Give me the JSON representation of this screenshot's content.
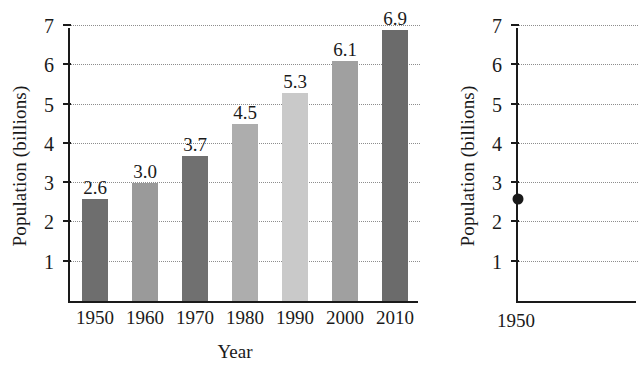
{
  "chart_data": [
    {
      "id": "world-population-bar",
      "type": "bar",
      "title": "",
      "xlabel": "Year",
      "ylabel": "Population (billions)",
      "categories": [
        "1950",
        "1960",
        "1970",
        "1980",
        "1990",
        "2000",
        "2010"
      ],
      "values": [
        2.6,
        3.0,
        3.7,
        4.5,
        5.3,
        6.1,
        6.9
      ],
      "value_labels": [
        "2.6",
        "3.0",
        "3.7",
        "4.5",
        "5.3",
        "6.1",
        "6.9"
      ],
      "bar_colors": [
        "#6e6e6e",
        "#9a9a9a",
        "#707070",
        "#adadad",
        "#c9c9c9",
        "#a0a0a0",
        "#6b6b6b"
      ],
      "ylim": [
        0,
        7
      ],
      "yticks": [
        1,
        2,
        3,
        4,
        5,
        6,
        7
      ],
      "ytick_labels": [
        "1",
        "2",
        "3",
        "4",
        "5",
        "6",
        "7"
      ],
      "grid": "horizontal-dotted",
      "legend": "none"
    },
    {
      "id": "world-population-scatter-partial",
      "type": "scatter",
      "title": "",
      "xlabel": "",
      "ylabel": "Population (billions)",
      "note": "second panel, clipped at right edge of screenshot",
      "categories": [
        "1950"
      ],
      "x": [
        "1950"
      ],
      "values": [
        2.6
      ],
      "point_color": "#1a1a1a",
      "ylim": [
        0,
        7
      ],
      "yticks": [
        1,
        2,
        3,
        4,
        5,
        6,
        7
      ],
      "ytick_labels": [
        "1",
        "2",
        "3",
        "4",
        "5",
        "6",
        "7"
      ],
      "xtick_labels": [
        "1950"
      ],
      "grid": "horizontal-dotted",
      "legend": "none"
    }
  ]
}
